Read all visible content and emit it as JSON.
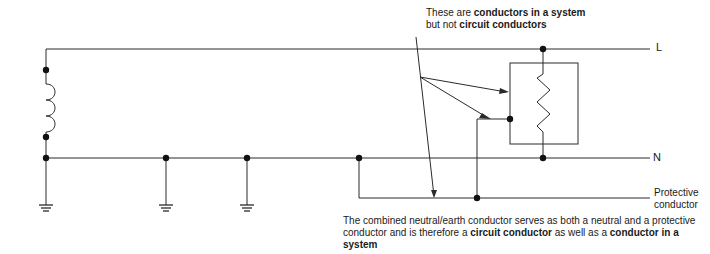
{
  "diagram": {
    "lines": {
      "line": "L",
      "neutral": "N",
      "protective_1": "Protective",
      "protective_2": "conductor"
    },
    "top_note": {
      "pre": "These are ",
      "bold1": "conductors in a system",
      "line2_pre": "but not ",
      "bold2": "circuit conductors"
    },
    "bottom_note": {
      "text1": "The combined neutral/earth conductor serves as both a neutral and a protective conductor and is therefore a ",
      "bold1": "circuit conductor",
      "text2": " as well as a ",
      "bold2": "conductor in a system"
    },
    "colors": {
      "stroke": "#2a2a2a",
      "background": "#ffffff"
    }
  }
}
